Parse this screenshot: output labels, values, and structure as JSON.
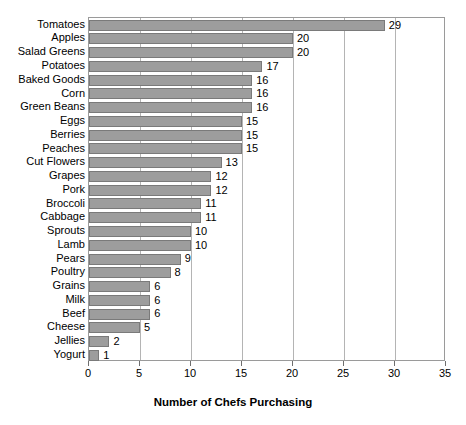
{
  "chart_data": {
    "type": "bar",
    "orientation": "horizontal",
    "title": "",
    "xlabel": "Number of Chefs Purchasing",
    "ylabel": "",
    "xlim": [
      0,
      35
    ],
    "xticks": [
      0,
      5,
      10,
      15,
      20,
      25,
      30,
      35
    ],
    "grid": true,
    "legend": null,
    "bar_color": "#9d9d9d",
    "bar_border_color": "#7a7a7a",
    "show_value_labels": true,
    "categories": [
      "Tomatoes",
      "Apples",
      "Salad Greens",
      "Potatoes",
      "Baked Goods",
      "Corn",
      "Green Beans",
      "Eggs",
      "Berries",
      "Peaches",
      "Cut Flowers",
      "Grapes",
      "Pork",
      "Broccoli",
      "Cabbage",
      "Sprouts",
      "Lamb",
      "Pears",
      "Poultry",
      "Grains",
      "Milk",
      "Beef",
      "Cheese",
      "Jellies",
      "Yogurt"
    ],
    "values": [
      29,
      20,
      20,
      17,
      16,
      16,
      16,
      15,
      15,
      15,
      13,
      12,
      12,
      11,
      11,
      10,
      10,
      9,
      8,
      6,
      6,
      6,
      5,
      2,
      1
    ]
  }
}
